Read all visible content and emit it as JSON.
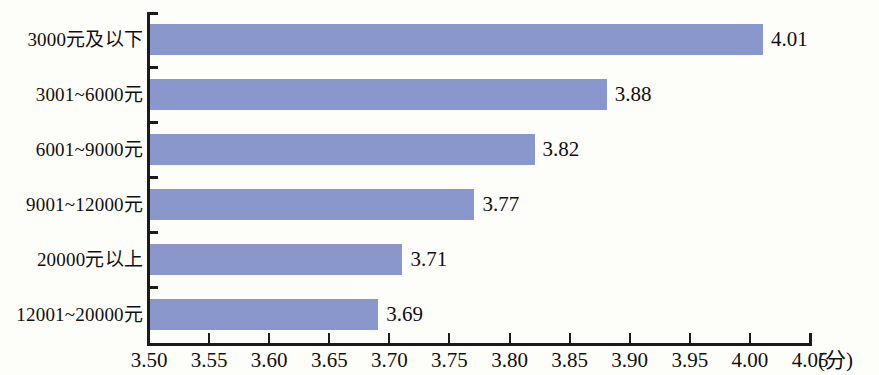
{
  "chart_data": {
    "type": "bar",
    "orientation": "horizontal",
    "title": "",
    "subtitle": "",
    "xlabel": "(分)",
    "ylabel": "",
    "categories": [
      "3000元及以下",
      "3001~6000元",
      "6001~9000元",
      "9001~12000元",
      "20000元以上",
      "12001~20000元"
    ],
    "values": [
      4.01,
      3.88,
      3.82,
      3.77,
      3.71,
      3.69
    ],
    "value_labels": [
      "4.01",
      "3.88",
      "3.82",
      "3.77",
      "3.71",
      "3.69"
    ],
    "xlim": [
      3.5,
      4.05
    ],
    "xticks": [
      3.5,
      3.55,
      3.6,
      3.65,
      3.7,
      3.75,
      3.8,
      3.85,
      3.9,
      3.95,
      4.0,
      4.05
    ],
    "xtick_labels": [
      "3.50",
      "3.55",
      "3.60",
      "3.65",
      "3.70",
      "3.75",
      "3.80",
      "3.85",
      "3.90",
      "3.95",
      "4.00",
      "4.05"
    ],
    "grid": false,
    "legend": null,
    "bar_color": "#8a97cc",
    "axis_color": "#1b1b1b",
    "background_color": "#fdfdfa"
  }
}
